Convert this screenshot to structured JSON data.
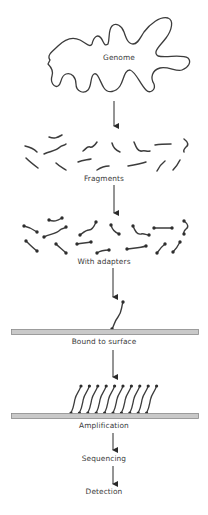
{
  "diagram": {
    "type": "flowchart",
    "direction": "top-to-bottom",
    "steps": [
      {
        "id": "genome",
        "label": "Genome"
      },
      {
        "id": "fragments",
        "label": "Fragments"
      },
      {
        "id": "adapters",
        "label": "With adapters"
      },
      {
        "id": "bound",
        "label": "Bound to surface"
      },
      {
        "id": "amplification",
        "label": "Amplification"
      },
      {
        "id": "sequencing",
        "label": "Sequencing"
      },
      {
        "id": "detection",
        "label": "Detection"
      }
    ],
    "edges": [
      {
        "from": "genome",
        "to": "fragments"
      },
      {
        "from": "fragments",
        "to": "adapters"
      },
      {
        "from": "adapters",
        "to": "bound"
      },
      {
        "from": "bound",
        "to": "amplification"
      },
      {
        "from": "amplification",
        "to": "sequencing"
      },
      {
        "from": "sequencing",
        "to": "detection"
      }
    ],
    "colors": {
      "stroke": "#3c3c3c",
      "surface_fill": "#c9c9c9",
      "surface_stroke": "#8a8a8a",
      "text": "#3a3a3a"
    },
    "cluster_strand_count": 10
  }
}
